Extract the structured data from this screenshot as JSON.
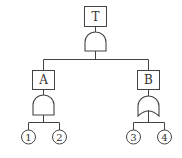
{
  "diagram": {
    "type": "fault-tree",
    "top_event": {
      "label": "T",
      "gate": "AND"
    },
    "intermediate_events": [
      {
        "label": "A",
        "gate": "AND",
        "inputs": [
          "1",
          "2"
        ]
      },
      {
        "label": "B",
        "gate": "OR",
        "inputs": [
          "3",
          "4"
        ]
      }
    ],
    "basic_events": [
      "1",
      "2",
      "3",
      "4"
    ]
  }
}
